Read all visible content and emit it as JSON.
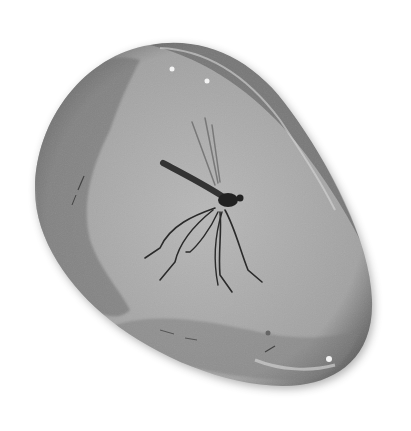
{
  "image": {
    "subject": "insect-in-amber",
    "description": "Grayscale illustration of a mosquito-like insect preserved in a polished amber stone",
    "width": 411,
    "height": 431,
    "colors": {
      "background": "#ffffff",
      "stone_edge": "#3a3a3a",
      "stone_mid": "#8a8a8a",
      "stone_light": "#b4b4b4",
      "insect": "#2a2a2a",
      "highlight": "#f4f4f4"
    }
  }
}
